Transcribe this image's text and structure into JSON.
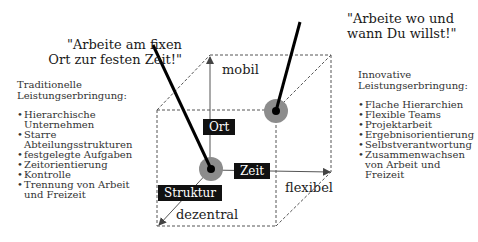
{
  "quotes": {
    "traditional": [
      "\"Arbeite am fixen",
      "Ort zur festen Zeit!\""
    ],
    "innovative": [
      "\"Arbeite wo und",
      "wann Du willst!\""
    ]
  },
  "traditional_panel": {
    "title": [
      "Traditionelle",
      "Leistungserbringung:"
    ],
    "items": [
      "Hierarchische Unternehmen",
      "Starre Abteilungsstrukturen",
      "festgelegte Aufgaben",
      "Zeitorientierung",
      "Kontrolle",
      "Trennung von Arbeit und Freizeit"
    ]
  },
  "innovative_panel": {
    "title": [
      "Innovative",
      "Leistungserbringung:"
    ],
    "items": [
      "Flache Hierarchien",
      "Flexible Teams",
      "Projektarbeit",
      "Ergebnisorientierung",
      "Selbstverantwortung",
      "Zusammenwachsen von Arbeit und Freizeit"
    ]
  },
  "cube": {
    "axes": {
      "vertical": {
        "dimension": "Ort",
        "label": "mobil"
      },
      "horizontal": {
        "dimension": "Zeit",
        "label": "flexibel"
      },
      "depth": {
        "dimension": "Struktur",
        "label": "dezentral"
      }
    },
    "colors": {
      "marker_outer": "#8c8c8c",
      "marker_inner": "#000000",
      "dimension_box": "#111111",
      "dashed_edge": "#555555"
    }
  }
}
